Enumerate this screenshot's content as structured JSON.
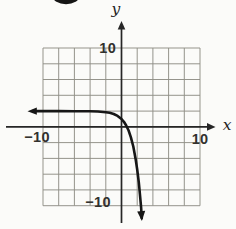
{
  "figure": {
    "x_axis_label": "x",
    "y_axis_label": "y",
    "ticks": {
      "y_top": "10",
      "y_bottom": "−10",
      "x_left": "−10",
      "x_right": "10"
    },
    "colors": {
      "background": "#fbfbf9",
      "grid": "#8f8e86",
      "axis": "#262626",
      "curve": "#161616",
      "label": "#32312e"
    }
  },
  "chart_data": {
    "type": "line",
    "title": "",
    "xlabel": "x",
    "ylabel": "y",
    "xlim": [
      -10,
      10
    ],
    "ylim": [
      -10,
      10
    ],
    "grid": true,
    "grid_spacing": 2,
    "x_tick_labels_shown": [
      "-10",
      "10"
    ],
    "y_tick_labels_shown": [
      "10",
      "-10"
    ],
    "legend": "none",
    "series": [
      {
        "name": "exponential curve (approx. y = 2 - e^x)",
        "horizontal_asymptote_y": 2,
        "x_intercept_approx": 0.8,
        "y_intercept_approx": 1,
        "arrows": [
          "left end toward x = -infinity at y = 2",
          "lower end downward past y = -10 near x = 2.5"
        ],
        "points": [
          [
            -11.3,
            2.0
          ],
          [
            -8,
            2.0
          ],
          [
            -6,
            1.99
          ],
          [
            -4,
            1.98
          ],
          [
            -3,
            1.95
          ],
          [
            -2,
            1.86
          ],
          [
            -1.5,
            1.78
          ],
          [
            -1,
            1.63
          ],
          [
            -0.5,
            1.39
          ],
          [
            0,
            1.0
          ],
          [
            0.3,
            0.65
          ],
          [
            0.6,
            0.18
          ],
          [
            0.9,
            -0.46
          ],
          [
            1.2,
            -1.32
          ],
          [
            1.5,
            -2.48
          ],
          [
            1.8,
            -4.05
          ],
          [
            2.0,
            -5.39
          ],
          [
            2.2,
            -7.03
          ],
          [
            2.35,
            -8.49
          ],
          [
            2.5,
            -10.18
          ],
          [
            2.58,
            -11.55
          ]
        ]
      }
    ]
  }
}
